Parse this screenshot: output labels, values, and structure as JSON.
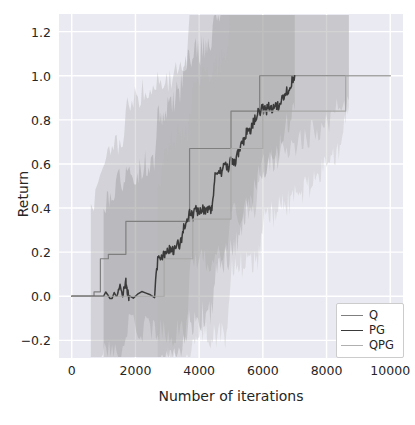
{
  "chart_data": {
    "type": "line",
    "title": "",
    "xlabel": "Number of iterations",
    "ylabel": "Return",
    "xlim": [
      -400,
      10400
    ],
    "ylim": [
      -0.28,
      1.28
    ],
    "xticks": [
      0,
      2000,
      4000,
      6000,
      8000,
      10000
    ],
    "xtick_labels": [
      "0",
      "2000",
      "4000",
      "6000",
      "8000",
      "10000"
    ],
    "yticks": [
      -0.2,
      0.0,
      0.2,
      0.4,
      0.6,
      0.8,
      1.0,
      1.2
    ],
    "ytick_labels": [
      "−0.2",
      "0.0",
      "0.2",
      "0.4",
      "0.6",
      "0.8",
      "1.0",
      "1.2"
    ],
    "grid": true,
    "grid_color": "#ffffff",
    "plot_background": "#eaeaf2",
    "figure_background": "#ffffff",
    "legend_position": "lower right",
    "legend_entries": [
      "Q",
      "PG",
      "QPG"
    ],
    "series": [
      {
        "name": "Q",
        "color": "#7f7f7f",
        "linewidth": 1.2,
        "band_color": "#9a9a9a",
        "band_opacity": 0.3,
        "x": [
          0,
          600,
          700,
          800,
          900,
          1000,
          1100,
          1150,
          1200,
          1600,
          1700,
          2600,
          2700,
          2800,
          3600,
          3700,
          3800,
          4900,
          5000,
          5100,
          5800,
          5900,
          6000,
          10000
        ],
        "y": [
          0.0,
          0.0,
          0.02,
          0.02,
          0.17,
          0.17,
          0.17,
          0.19,
          0.19,
          0.19,
          0.34,
          0.34,
          0.34,
          0.34,
          0.34,
          0.67,
          0.67,
          0.67,
          0.84,
          0.84,
          0.84,
          1.0,
          1.0,
          1.0
        ],
        "band_lower": [
          -0.2,
          -0.2,
          -0.2,
          -0.2,
          -0.2,
          -0.2,
          -0.2,
          -0.2,
          -0.2,
          -0.2,
          -0.2,
          -0.2,
          -0.2,
          -0.2,
          -0.2,
          0.0,
          0.0,
          0.0,
          0.34,
          0.34,
          0.34,
          0.46,
          0.46,
          0.46
        ],
        "band_upper": [
          0.2,
          0.2,
          0.35,
          0.35,
          0.7,
          0.7,
          0.7,
          0.85,
          0.85,
          0.85,
          1.0,
          1.0,
          1.0,
          1.0,
          1.0,
          1.2,
          1.2,
          1.2,
          1.2,
          1.2,
          1.2,
          1.2,
          1.2,
          1.2
        ],
        "band_x_start": 600,
        "band_x_end": 8700
      },
      {
        "name": "PG",
        "color": "#3a3a3a",
        "linewidth": 1.5,
        "band_color": "#8a8a8a",
        "band_opacity": 0.32,
        "x": [
          0,
          1000,
          1400,
          1500,
          1600,
          1700,
          1750,
          1800,
          2600,
          2700,
          2800,
          2900,
          3000,
          3100,
          3200,
          3300,
          3400,
          3500,
          3600,
          3700,
          3800,
          3900,
          4000,
          4100,
          4200,
          4300,
          4400,
          4500,
          4600,
          4700,
          4800,
          4900,
          5000,
          5100,
          5200,
          5300,
          5400,
          5500,
          5600,
          5700,
          5800,
          5900,
          6000,
          6100,
          6200,
          6300,
          6400,
          6500,
          6600,
          6700,
          6800,
          6900,
          7000
        ],
        "y": [
          0.0,
          0.0,
          0.0,
          0.05,
          0.0,
          0.06,
          0.02,
          0.0,
          0.0,
          0.17,
          0.18,
          0.19,
          0.2,
          0.22,
          0.2,
          0.25,
          0.23,
          0.3,
          0.35,
          0.38,
          0.36,
          0.4,
          0.37,
          0.4,
          0.38,
          0.41,
          0.39,
          0.55,
          0.58,
          0.56,
          0.6,
          0.58,
          0.62,
          0.6,
          0.64,
          0.68,
          0.7,
          0.75,
          0.74,
          0.79,
          0.82,
          0.84,
          0.85,
          0.84,
          0.86,
          0.85,
          0.87,
          0.86,
          0.9,
          0.92,
          0.94,
          0.97,
          1.0
        ],
        "band_x_start": 1000,
        "band_x_end": 7000
      },
      {
        "name": "QPG",
        "color": "#a8a8a8",
        "linewidth": 1.2,
        "band_color": "#b4b4b4",
        "band_opacity": 0.3,
        "x": [
          0,
          2700,
          2800,
          2900,
          3700,
          3800,
          3900,
          4900,
          5000,
          5100,
          5900,
          6000,
          8400,
          8500,
          8600,
          10000
        ],
        "y": [
          0.0,
          0.0,
          0.0,
          0.17,
          0.17,
          0.35,
          0.35,
          0.35,
          0.67,
          0.67,
          0.67,
          0.84,
          0.84,
          0.84,
          1.0,
          1.0
        ],
        "band_x_start": 2700,
        "band_x_end": 8700
      }
    ]
  },
  "axes": {
    "xlabel": "Number of iterations",
    "ylabel": "Return"
  },
  "legend": {
    "items": [
      {
        "label": "Q",
        "color": "#7f7f7f",
        "width": "1.3px"
      },
      {
        "label": "PG",
        "color": "#3a3a3a",
        "width": "1.9px"
      },
      {
        "label": "QPG",
        "color": "#b0b0b0",
        "width": "1.3px"
      }
    ]
  }
}
